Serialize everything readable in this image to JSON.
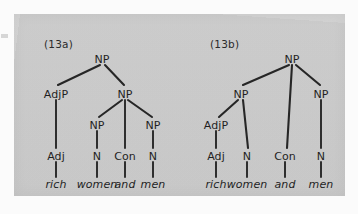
{
  "figure": {
    "caption_a": "(13a)",
    "caption_b": "(13b)",
    "panel_color": "#d3d3d3",
    "line_color": "#262626",
    "text_color": "#1f1f1f"
  },
  "trees": [
    {
      "id": "13a",
      "label": "(13a)",
      "reading": "rich (women and men) — adjective scopes over the whole coordination",
      "nodes": [
        {
          "name": "root-np",
          "label": "NP",
          "x": 88,
          "y": 46
        },
        {
          "name": "adjp",
          "label": "AdjP",
          "x": 42,
          "y": 81
        },
        {
          "name": "inner-np",
          "label": "NP",
          "x": 111,
          "y": 81
        },
        {
          "name": "np-left",
          "label": "NP",
          "x": 83,
          "y": 112
        },
        {
          "name": "np-right",
          "label": "NP",
          "x": 139,
          "y": 112
        },
        {
          "name": "adj",
          "label": "Adj",
          "x": 42,
          "y": 143
        },
        {
          "name": "n-women",
          "label": "N",
          "x": 83,
          "y": 143
        },
        {
          "name": "con",
          "label": "Con",
          "x": 111,
          "y": 143
        },
        {
          "name": "n-men",
          "label": "N",
          "x": 139,
          "y": 143
        }
      ],
      "leaves": [
        {
          "name": "leaf-rich",
          "word": "rich",
          "x": 42,
          "y": 171
        },
        {
          "name": "leaf-women",
          "word": "women",
          "x": 83,
          "y": 171
        },
        {
          "name": "leaf-and",
          "word": "and",
          "x": 111,
          "y": 171
        },
        {
          "name": "leaf-men",
          "word": "men",
          "x": 139,
          "y": 171
        }
      ],
      "edges": [
        {
          "name": "edge-root-adjp",
          "x1": 86,
          "y1": 51,
          "x2": 44,
          "y2": 71
        },
        {
          "name": "edge-root-innernp",
          "x1": 91,
          "y1": 51,
          "x2": 110,
          "y2": 71
        },
        {
          "name": "edge-adjp-adj",
          "x1": 42,
          "y1": 86,
          "x2": 42,
          "y2": 134
        },
        {
          "name": "edge-innernp-npleft",
          "x1": 108,
          "y1": 86,
          "x2": 85,
          "y2": 103
        },
        {
          "name": "edge-innernp-con",
          "x1": 111,
          "y1": 86,
          "x2": 111,
          "y2": 134
        },
        {
          "name": "edge-innernp-npright",
          "x1": 114,
          "y1": 86,
          "x2": 138,
          "y2": 103
        },
        {
          "name": "edge-npleft-n",
          "x1": 83,
          "y1": 117,
          "x2": 83,
          "y2": 134
        },
        {
          "name": "edge-npright-n",
          "x1": 139,
          "y1": 117,
          "x2": 139,
          "y2": 134
        },
        {
          "name": "edge-adj-rich",
          "x1": 42,
          "y1": 148,
          "x2": 42,
          "y2": 163
        },
        {
          "name": "edge-n-women",
          "x1": 83,
          "y1": 148,
          "x2": 83,
          "y2": 163
        },
        {
          "name": "edge-con-and",
          "x1": 111,
          "y1": 148,
          "x2": 111,
          "y2": 163
        },
        {
          "name": "edge-n-men",
          "x1": 139,
          "y1": 148,
          "x2": 139,
          "y2": 163
        }
      ]
    },
    {
      "id": "13b",
      "label": "(13b)",
      "reading": "(rich women) and men — adjective scopes only over the first conjunct",
      "nodes": [
        {
          "name": "root-np",
          "label": "NP",
          "x": 112,
          "y": 46
        },
        {
          "name": "np-left",
          "label": "NP",
          "x": 61,
          "y": 81
        },
        {
          "name": "np-right",
          "label": "NP",
          "x": 141,
          "y": 81
        },
        {
          "name": "adjp",
          "label": "AdjP",
          "x": 36,
          "y": 112
        },
        {
          "name": "adj",
          "label": "Adj",
          "x": 36,
          "y": 143
        },
        {
          "name": "n-women",
          "label": "N",
          "x": 67,
          "y": 143
        },
        {
          "name": "con",
          "label": "Con",
          "x": 105,
          "y": 143
        },
        {
          "name": "n-men",
          "label": "N",
          "x": 141,
          "y": 143
        }
      ],
      "leaves": [
        {
          "name": "leaf-rich",
          "word": "rich",
          "x": 36,
          "y": 171
        },
        {
          "name": "leaf-women",
          "word": "women",
          "x": 67,
          "y": 171
        },
        {
          "name": "leaf-and",
          "word": "and",
          "x": 105,
          "y": 171
        },
        {
          "name": "leaf-men",
          "word": "men",
          "x": 141,
          "y": 171
        }
      ],
      "edges": [
        {
          "name": "edge-root-npleft",
          "x1": 109,
          "y1": 51,
          "x2": 63,
          "y2": 71
        },
        {
          "name": "edge-root-con",
          "x1": 112,
          "y1": 51,
          "x2": 107,
          "y2": 134
        },
        {
          "name": "edge-root-npright",
          "x1": 116,
          "y1": 51,
          "x2": 140,
          "y2": 71
        },
        {
          "name": "edge-npleft-adjp",
          "x1": 58,
          "y1": 86,
          "x2": 39,
          "y2": 103
        },
        {
          "name": "edge-npleft-n",
          "x1": 63,
          "y1": 86,
          "x2": 68,
          "y2": 134
        },
        {
          "name": "edge-adjp-adj",
          "x1": 36,
          "y1": 117,
          "x2": 36,
          "y2": 134
        },
        {
          "name": "edge-npright-n",
          "x1": 141,
          "y1": 86,
          "x2": 141,
          "y2": 134
        },
        {
          "name": "edge-adj-rich",
          "x1": 36,
          "y1": 148,
          "x2": 36,
          "y2": 163
        },
        {
          "name": "edge-n-women",
          "x1": 67,
          "y1": 148,
          "x2": 67,
          "y2": 163
        },
        {
          "name": "edge-con-and",
          "x1": 105,
          "y1": 148,
          "x2": 105,
          "y2": 163
        },
        {
          "name": "edge-n-men",
          "x1": 141,
          "y1": 148,
          "x2": 141,
          "y2": 163
        }
      ]
    }
  ],
  "captions": {
    "a": {
      "x": 30,
      "y": 24,
      "text": "(13a)"
    },
    "b": {
      "x": 30,
      "y": 24,
      "text": "(13b)"
    }
  }
}
